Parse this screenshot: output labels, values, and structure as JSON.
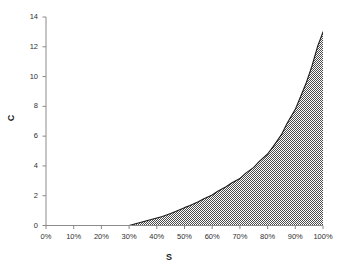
{
  "chart_data": {
    "type": "area",
    "title": "",
    "xlabel": "S",
    "ylabel": "C",
    "grid": false,
    "legend": false,
    "legend_position": "none",
    "xlim": [
      0,
      100
    ],
    "ylim": [
      0,
      14
    ],
    "x_tick_labels": [
      "0%",
      "10%",
      "20%",
      "30%",
      "40%",
      "50%",
      "60%",
      "70%",
      "80%",
      "90%",
      "100%"
    ],
    "x_ticks": [
      0,
      10,
      20,
      30,
      40,
      50,
      60,
      70,
      80,
      90,
      100
    ],
    "y_tick_labels": [
      "0",
      "2",
      "4",
      "6",
      "8",
      "10",
      "12",
      "14"
    ],
    "y_ticks": [
      0,
      2,
      4,
      6,
      8,
      10,
      12,
      14
    ],
    "series": [
      {
        "name": "C",
        "fill": "hatched-gray",
        "line_color": "#1a1a1a",
        "x": [
          0,
          5,
          10,
          15,
          20,
          25,
          30,
          32,
          35,
          37,
          40,
          42,
          45,
          47,
          50,
          52,
          55,
          57,
          60,
          62,
          65,
          67,
          70,
          72,
          75,
          77,
          80,
          82,
          85,
          87,
          90,
          92,
          94,
          96,
          98,
          99,
          100
        ],
        "values": [
          0,
          0,
          0,
          0,
          0,
          0,
          0,
          0.1,
          0.25,
          0.35,
          0.5,
          0.6,
          0.8,
          0.95,
          1.2,
          1.35,
          1.6,
          1.8,
          2.05,
          2.3,
          2.6,
          2.85,
          3.15,
          3.5,
          3.9,
          4.3,
          4.8,
          5.3,
          6.1,
          6.85,
          7.8,
          8.7,
          9.6,
          10.7,
          12.0,
          12.5,
          13.0
        ]
      }
    ],
    "annotations": []
  },
  "axis": {
    "x_title": "S",
    "y_title": "C"
  },
  "colors": {
    "background": "#ffffff",
    "axis": "#8a8a8a",
    "curve": "#1a1a1a",
    "fill_dither_dark": "#4d4d4d",
    "fill_dither_light": "#ffffff",
    "text": "#2f2f2f"
  }
}
